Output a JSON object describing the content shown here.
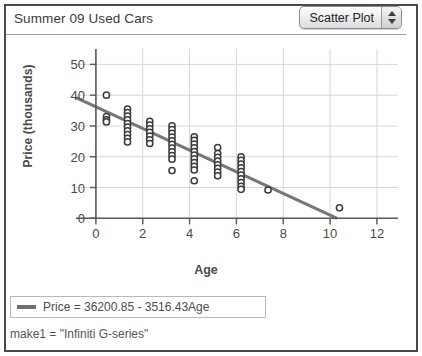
{
  "window": {
    "title": "Summer 09 Used Cars"
  },
  "toolbar": {
    "plot_type_label": "Scatter Plot",
    "stepper_up_icon": "triangle-up-icon",
    "stepper_down_icon": "triangle-down-icon"
  },
  "legend": {
    "entry_label": "Price = 36200.85 - 3516.43Age",
    "swatch_color": "#6f6f6f"
  },
  "status": {
    "text": "make1 = \"Infiniti  G-series\""
  },
  "colors": {
    "point_stroke": "#3b3b3b",
    "point_fill": "#ffffff",
    "fit_line": "#777777",
    "grid": "#d8d8d8",
    "axis": "#595959",
    "frame": "#4a4a4a",
    "text": "#4a4a4a"
  },
  "chart_data": {
    "type": "scatter",
    "title": "Summer 09 Used Cars",
    "xlabel": "Age",
    "ylabel": "Price (thousands)",
    "xlim": [
      -0.85,
      12.9
    ],
    "ylim": [
      -2.5,
      55
    ],
    "xticks": [
      0,
      2,
      4,
      6,
      8,
      10,
      12
    ],
    "yticks": [
      0,
      10,
      20,
      30,
      40,
      50
    ],
    "grid": true,
    "legend_position": "below-plot",
    "fit_line": {
      "label": "Price = 36200.85 - 3516.43Age",
      "intercept": 36200.85,
      "slope": -3516.43,
      "intercept_thousands": 36.2,
      "slope_thousands": -3.51643,
      "x_start": -0.85,
      "x_end": 10.3
    },
    "series": [
      {
        "name": "Used cars",
        "marker": "open-circle",
        "points": [
          [
            0.45,
            40.0
          ],
          [
            0.45,
            33.0
          ],
          [
            0.45,
            32.0
          ],
          [
            0.45,
            31.3
          ],
          [
            1.35,
            35.5
          ],
          [
            1.35,
            34.3
          ],
          [
            1.35,
            33.2
          ],
          [
            1.35,
            32.0
          ],
          [
            1.35,
            30.8
          ],
          [
            1.35,
            29.6
          ],
          [
            1.35,
            28.4
          ],
          [
            1.35,
            27.2
          ],
          [
            1.35,
            26.0
          ],
          [
            1.35,
            24.8
          ],
          [
            2.3,
            31.5
          ],
          [
            2.3,
            30.3
          ],
          [
            2.3,
            29.1
          ],
          [
            2.3,
            27.9
          ],
          [
            2.3,
            26.7
          ],
          [
            2.3,
            25.5
          ],
          [
            2.3,
            24.3
          ],
          [
            3.25,
            30.0
          ],
          [
            3.25,
            28.8
          ],
          [
            3.25,
            27.6
          ],
          [
            3.25,
            26.4
          ],
          [
            3.25,
            25.2
          ],
          [
            3.25,
            24.0
          ],
          [
            3.25,
            22.8
          ],
          [
            3.25,
            21.6
          ],
          [
            3.25,
            20.4
          ],
          [
            3.25,
            19.2
          ],
          [
            3.25,
            15.5
          ],
          [
            4.2,
            26.5
          ],
          [
            4.2,
            25.3
          ],
          [
            4.2,
            24.1
          ],
          [
            4.2,
            22.9
          ],
          [
            4.2,
            21.7
          ],
          [
            4.2,
            20.5
          ],
          [
            4.2,
            19.3
          ],
          [
            4.2,
            18.1
          ],
          [
            4.2,
            16.9
          ],
          [
            4.2,
            15.7
          ],
          [
            4.2,
            12.2
          ],
          [
            5.2,
            23.0
          ],
          [
            5.2,
            21.0
          ],
          [
            5.2,
            19.8
          ],
          [
            5.2,
            18.6
          ],
          [
            5.2,
            17.4
          ],
          [
            5.2,
            16.2
          ],
          [
            5.2,
            15.0
          ],
          [
            5.2,
            13.8
          ],
          [
            6.2,
            20.0
          ],
          [
            6.2,
            18.8
          ],
          [
            6.2,
            17.6
          ],
          [
            6.2,
            16.4
          ],
          [
            6.2,
            15.2
          ],
          [
            6.2,
            14.0
          ],
          [
            6.2,
            12.8
          ],
          [
            6.2,
            11.6
          ],
          [
            6.2,
            10.4
          ],
          [
            6.2,
            9.4
          ],
          [
            7.35,
            9.2
          ],
          [
            10.4,
            3.4
          ]
        ]
      }
    ]
  }
}
